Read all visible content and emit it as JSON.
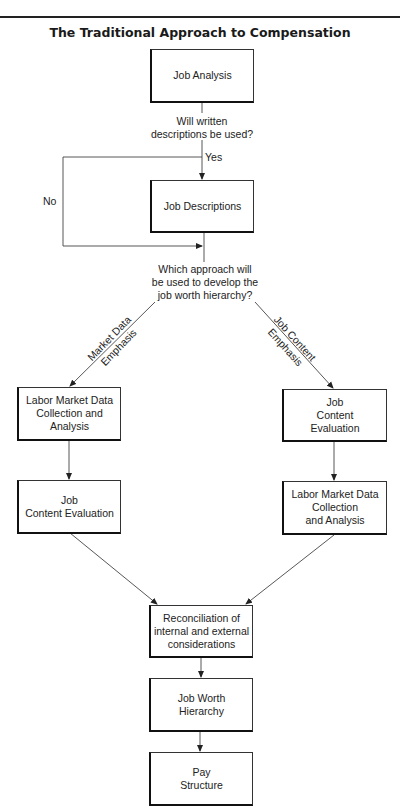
{
  "title": "The Traditional Approach to Compensation",
  "nodes": {
    "job_analysis": "Job Analysis",
    "job_descriptions": "Job Descriptions",
    "left_labor_market": "Labor Market Data\nCollection and\nAnalysis",
    "left_job_content": "Job\nContent Evaluation",
    "right_job_content": "Job\nContent\nEvaluation",
    "right_labor_market": "Labor Market Data\nCollection\nand Analysis",
    "reconciliation": "Reconciliation of\ninternal and external\nconsiderations",
    "job_worth_hierarchy": "Job Worth\nHierarchy",
    "pay_structure": "Pay\nStructure"
  },
  "decisions": {
    "written_descriptions": "Will written\ndescriptions be used?",
    "approach": "Which approach will\nbe used to develop the\njob worth hierarchy?"
  },
  "edge_labels": {
    "yes": "Yes",
    "no": "No",
    "market_data_emphasis": "Market Data\nEmphasis",
    "job_content_emphasis": "Job Content\nEmphasis"
  }
}
